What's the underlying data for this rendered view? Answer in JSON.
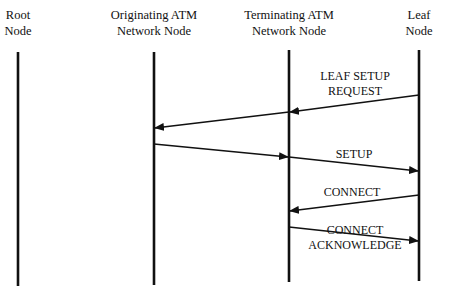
{
  "diagram": {
    "type": "sequence-diagram",
    "participants": [
      {
        "id": "root",
        "label_line1": "Root",
        "label_line2": "Node",
        "x": 18
      },
      {
        "id": "orig",
        "label_line1": "Originating ATM",
        "label_line2": "Network Node",
        "x": 154
      },
      {
        "id": "term",
        "label_line1": "Terminating ATM",
        "label_line2": "Network Node",
        "x": 289
      },
      {
        "id": "leaf",
        "label_line1": "Leaf",
        "label_line2": "Node",
        "x": 419
      }
    ],
    "messages": [
      {
        "id": "leaf-setup-request",
        "label_line1": "LEAF SETUP",
        "label_line2": "REQUEST",
        "from": "leaf",
        "to": "orig",
        "via": "term"
      },
      {
        "id": "setup",
        "label_line1": "SETUP",
        "label_line2": "",
        "from": "orig",
        "to": "leaf",
        "via": "term"
      },
      {
        "id": "connect",
        "label_line1": "CONNECT",
        "label_line2": "",
        "from": "leaf",
        "to": "term"
      },
      {
        "id": "connect-ack",
        "label_line1": "CONNECT",
        "label_line2": "ACKNOWLEDGE",
        "from": "term",
        "to": "leaf"
      }
    ]
  }
}
